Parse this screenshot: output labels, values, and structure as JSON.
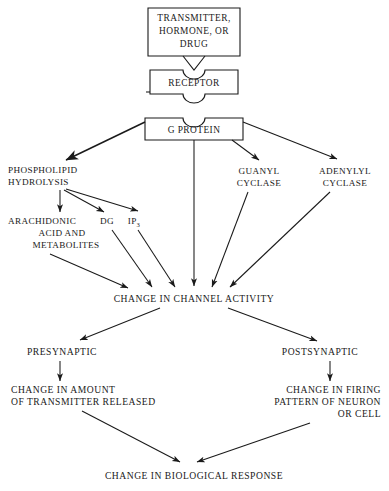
{
  "diagram": {
    "style": {
      "background": "#ffffff",
      "ink": "#1a1a1a"
    },
    "boxes": [
      {
        "id": "transmitter",
        "lines": [
          "TRANSMITTER,",
          "HORMONE, OR",
          "DRUG"
        ]
      },
      {
        "id": "receptor",
        "lines": [
          "RECEPTOR"
        ]
      },
      {
        "id": "g-protein",
        "lines": [
          "G PROTEIN"
        ]
      }
    ],
    "labels": [
      {
        "id": "phospholipid-hydrolysis",
        "lines": [
          "PHOSPHOLIPID",
          "HYDROLYSIS"
        ],
        "align": "left"
      },
      {
        "id": "guanyl-cyclase",
        "lines": [
          "GUANYL",
          "CYCLASE"
        ],
        "align": "center"
      },
      {
        "id": "adenylyl-cyclase",
        "lines": [
          "ADENYLYL",
          "CYCLASE"
        ],
        "align": "center"
      },
      {
        "id": "arachidonic-acid",
        "lines": [
          "ARACHIDONIC",
          "ACID AND",
          "METABOLITES"
        ],
        "align": "center"
      },
      {
        "id": "dg",
        "lines": [
          "DG"
        ],
        "align": "center"
      },
      {
        "id": "ip3",
        "text": "IP",
        "subscript": "3",
        "align": "center"
      },
      {
        "id": "change-in-channel-activity",
        "lines": [
          "CHANGE IN CHANNEL ACTIVITY"
        ],
        "align": "center"
      },
      {
        "id": "presynaptic",
        "lines": [
          "PRESYNAPTIC"
        ],
        "align": "center"
      },
      {
        "id": "postsynaptic",
        "lines": [
          "POSTSYNAPTIC"
        ],
        "align": "center"
      },
      {
        "id": "change-in-amount-of-transmitter-released",
        "lines": [
          "CHANGE IN AMOUNT",
          "OF TRANSMITTER RELEASED"
        ],
        "align": "left"
      },
      {
        "id": "change-in-firing-pattern",
        "lines": [
          "CHANGE IN FIRING",
          "PATTERN OF NEURON",
          "OR CELL"
        ],
        "align": "right"
      },
      {
        "id": "change-in-biological-response",
        "lines": [
          "CHANGE IN BIOLOGICAL RESPONSE"
        ],
        "align": "center"
      }
    ]
  },
  "text": {
    "transmitter_l1": "TRANSMITTER,",
    "transmitter_l2": "HORMONE, OR",
    "transmitter_l3": "DRUG",
    "receptor": "RECEPTOR",
    "g_protein": "G PROTEIN",
    "phospholipid_l1": "PHOSPHOLIPID",
    "phospholipid_l2": "HYDROLYSIS",
    "guanyl_l1": "GUANYL",
    "guanyl_l2": "CYCLASE",
    "adenylyl_l1": "ADENYLYL",
    "adenylyl_l2": "CYCLASE",
    "arachidonic_l1": "ARACHIDONIC",
    "arachidonic_l2": "ACID AND",
    "arachidonic_l3": "METABOLITES",
    "dg": "DG",
    "ip3_base": "IP",
    "ip3_sub": "3",
    "channel_activity": "CHANGE IN CHANNEL ACTIVITY",
    "presynaptic": "PRESYNAPTIC",
    "postsynaptic": "POSTSYNAPTIC",
    "transmitter_released_l1": "CHANGE IN AMOUNT",
    "transmitter_released_l2": "OF TRANSMITTER RELEASED",
    "firing_l1": "CHANGE IN FIRING",
    "firing_l2": "PATTERN OF NEURON",
    "firing_l3": "OR CELL",
    "biological_response": "CHANGE IN BIOLOGICAL RESPONSE"
  }
}
